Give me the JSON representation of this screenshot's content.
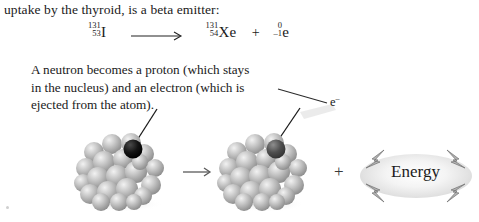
{
  "document": {
    "intro_text": "uptake by the thyroid, is a beta emitter:"
  },
  "equation": {
    "reactant": {
      "mass_number": "131",
      "atomic_number": "53",
      "symbol": "I"
    },
    "arrow": "long-right-arrow",
    "product_nuclide": {
      "mass_number": "131",
      "atomic_number": "54",
      "symbol": "Xe"
    },
    "plus": "+",
    "product_electron": {
      "mass_number": "0",
      "atomic_number": "–1",
      "symbol": "e"
    }
  },
  "caption": {
    "line1": "A neutron becomes a proton (which stays",
    "line2": "in the nucleus) and an electron (which is",
    "line3": "ejected from the atom)."
  },
  "annotations": {
    "electron_label": "e",
    "electron_superscript": "–"
  },
  "diagram": {
    "left_nucleus_name": "iodine-131 nucleus",
    "right_nucleus_name": "xenon-131 nucleus",
    "reaction_arrow": "right-arrow",
    "plus_sign": "+",
    "energy_label": "Energy",
    "highlight_neutron_color": "#0d0d0d",
    "highlight_proton_color": "#4a4a4a",
    "nucleon_color": "#b0b0b0",
    "energy_bolt_color": "#8d8d8d"
  }
}
